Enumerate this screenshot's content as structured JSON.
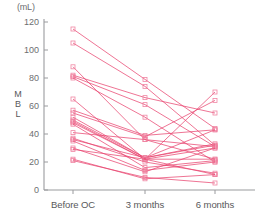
{
  "chart_data": {
    "type": "line",
    "title": "",
    "subtitle": "",
    "unit_label": "(mL)",
    "xlabel": "",
    "ylabel": "MBL",
    "ylabel_chars": [
      "M",
      "B",
      "L"
    ],
    "categories": [
      "Before OC",
      "3 months",
      "6 months"
    ],
    "x": [
      0,
      1,
      2
    ],
    "ylim": [
      0,
      120
    ],
    "yticks": [
      0,
      20,
      40,
      60,
      80,
      100,
      120
    ],
    "ytick_labels": [
      "0",
      "20",
      "40",
      "60",
      "80",
      "100",
      "120"
    ],
    "grid": false,
    "legend": "none",
    "marker": "open-square",
    "line_color": "#e8446f",
    "marker_color": "#ef7f9e",
    "axis_color": "#9a9b9e",
    "series": [
      {
        "name": "subject-1",
        "values": [
          115,
          79,
          44
        ]
      },
      {
        "name": "subject-2",
        "values": [
          105,
          74,
          32
        ]
      },
      {
        "name": "subject-3",
        "values": [
          88,
          36,
          31
        ]
      },
      {
        "name": "subject-4",
        "values": [
          82,
          66,
          55
        ]
      },
      {
        "name": "subject-5",
        "values": [
          81,
          61,
          31
        ]
      },
      {
        "name": "subject-6",
        "values": [
          80,
          52,
          20
        ]
      },
      {
        "name": "subject-7",
        "values": [
          65,
          22,
          70
        ]
      },
      {
        "name": "subject-8",
        "values": [
          57,
          39,
          43
        ]
      },
      {
        "name": "subject-9",
        "values": [
          55,
          38,
          64
        ]
      },
      {
        "name": "subject-10",
        "values": [
          52,
          23,
          33
        ]
      },
      {
        "name": "subject-11",
        "values": [
          50,
          23,
          43
        ]
      },
      {
        "name": "subject-12",
        "values": [
          49,
          22,
          30
        ]
      },
      {
        "name": "subject-13",
        "values": [
          48,
          22,
          22
        ]
      },
      {
        "name": "subject-14",
        "values": [
          47,
          16,
          21
        ]
      },
      {
        "name": "subject-15",
        "values": [
          41,
          36,
          22
        ]
      },
      {
        "name": "subject-16",
        "values": [
          37,
          20,
          12
        ]
      },
      {
        "name": "subject-17",
        "values": [
          36,
          23,
          32
        ]
      },
      {
        "name": "subject-18",
        "values": [
          35,
          14,
          20
        ]
      },
      {
        "name": "subject-19",
        "values": [
          30,
          13,
          30
        ]
      },
      {
        "name": "subject-20",
        "values": [
          29,
          22,
          11
        ]
      },
      {
        "name": "subject-21",
        "values": [
          22,
          8,
          11
        ]
      },
      {
        "name": "subject-22",
        "values": [
          21,
          9,
          5
        ]
      }
    ]
  }
}
